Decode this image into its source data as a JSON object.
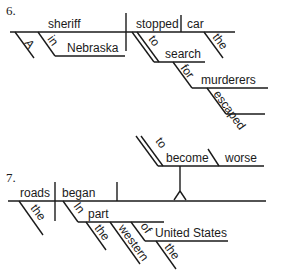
{
  "diagrams": [
    {
      "number": "6.",
      "words": {
        "subject": "sheriff",
        "subject_article": "A",
        "subject_prep": "in",
        "subject_prep_object": "Nebraska",
        "verb": "stopped",
        "direct_object": "car",
        "object_article": "the",
        "infinitive_marker": "to",
        "infinitive": "search",
        "prep": "for",
        "prep_object": "murderers",
        "participle": "escaped"
      }
    },
    {
      "number": "7.",
      "words": {
        "subject": "roads",
        "subject_article": "the",
        "verb": "began",
        "infinitive_marker": "to",
        "infinitive": "become",
        "complement": "worse",
        "prep1": "In",
        "prep1_object": "part",
        "prep1_article": "the",
        "prep1_adjective": "western",
        "prep2": "of",
        "prep2_object": "United States",
        "prep2_article": "the"
      }
    }
  ]
}
